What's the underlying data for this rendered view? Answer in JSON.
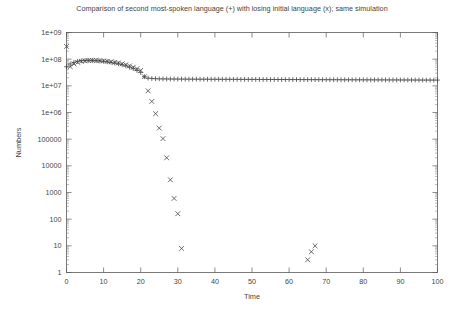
{
  "chart_data": {
    "type": "scatter",
    "title": "Comparison of second most-spoken language (+) with losing initial language (x); same simulation",
    "xlabel": "Time",
    "ylabel": "Numbers",
    "xlim": [
      0,
      100
    ],
    "ylim": [
      1,
      1000000000
    ],
    "yscale": "log",
    "xscale": "linear",
    "grid": false,
    "legend": "none",
    "xticks": [
      0,
      10,
      20,
      30,
      40,
      50,
      60,
      70,
      80,
      90,
      100
    ],
    "xtick_labels": [
      "0",
      "10",
      "20",
      "30",
      "40",
      "50",
      "60",
      "70",
      "80",
      "90",
      "100"
    ],
    "yticks": [
      1,
      10,
      100,
      1000,
      10000,
      100000,
      1000000,
      10000000,
      100000000,
      1000000000
    ],
    "ytick_labels": [
      "1",
      "10",
      "100",
      "1000",
      "10000",
      "100000",
      "1e+06",
      "1e+07",
      "1e+08",
      "1e+09"
    ],
    "series": [
      {
        "name": "second most-spoken language",
        "marker": "+",
        "color": "#3c3c3c",
        "x": [
          0,
          1,
          2,
          3,
          4,
          5,
          6,
          7,
          8,
          9,
          10,
          11,
          12,
          13,
          14,
          15,
          16,
          17,
          18,
          19,
          20,
          21,
          22,
          23,
          24,
          25,
          26,
          27,
          28,
          29,
          30,
          31,
          32,
          33,
          34,
          35,
          36,
          37,
          38,
          39,
          40,
          41,
          42,
          43,
          44,
          45,
          46,
          47,
          48,
          49,
          50,
          51,
          52,
          53,
          54,
          55,
          56,
          57,
          58,
          59,
          60,
          61,
          62,
          63,
          64,
          65,
          66,
          67,
          68,
          69,
          70,
          71,
          72,
          73,
          74,
          75,
          76,
          77,
          78,
          79,
          80,
          81,
          82,
          83,
          84,
          85,
          86,
          87,
          88,
          89,
          90,
          91,
          92,
          93,
          94,
          95,
          96,
          97,
          98,
          99,
          100
        ],
        "y": [
          52000000,
          66000000,
          76000000,
          83000000,
          87000000,
          89000000,
          90000000,
          89500000,
          88000000,
          86000000,
          83000000,
          80000000,
          76000000,
          72000000,
          67000000,
          62000000,
          56000000,
          50000000,
          44000000,
          38000000,
          32000000,
          22000000,
          19500000,
          18800000,
          18500000,
          18300000,
          18200000,
          18100000,
          18050000,
          18000000,
          17950000,
          17900000,
          17850000,
          17800000,
          17780000,
          17750000,
          17720000,
          17700000,
          17680000,
          17650000,
          17620000,
          17600000,
          17580000,
          17550000,
          17520000,
          17500000,
          17480000,
          17460000,
          17440000,
          17420000,
          17400000,
          17380000,
          17360000,
          17340000,
          17320000,
          17300000,
          17280000,
          17260000,
          17240000,
          17220000,
          17200000,
          17180000,
          17160000,
          17140000,
          17120000,
          17100000,
          17080000,
          17060000,
          17040000,
          17020000,
          17000000,
          16980000,
          16960000,
          16940000,
          16920000,
          16900000,
          16880000,
          16860000,
          16840000,
          16820000,
          16800000,
          16780000,
          16760000,
          16740000,
          16720000,
          16700000,
          16680000,
          16660000,
          16640000,
          16620000,
          16600000,
          16580000,
          16560000,
          16540000,
          16520000,
          16500000,
          16480000,
          16460000,
          16440000,
          16420000,
          16400000
        ]
      },
      {
        "name": "losing initial language",
        "marker": "x",
        "color": "#3c3c3c",
        "x": [
          0,
          1,
          2,
          3,
          4,
          5,
          6,
          7,
          8,
          9,
          10,
          11,
          12,
          13,
          14,
          15,
          16,
          17,
          18,
          19,
          20,
          21,
          22,
          23,
          24,
          25,
          26,
          27,
          28,
          29,
          30,
          31,
          65,
          66,
          67
        ],
        "y": [
          300000000,
          52000000,
          66000000,
          76000000,
          83000000,
          87000000,
          89000000,
          90000000,
          89500000,
          88000000,
          86000000,
          83000000,
          80000000,
          76000000,
          72000000,
          67000000,
          62000000,
          56000000,
          50000000,
          44000000,
          38000000,
          22000000,
          6500000,
          2600000,
          900000,
          260000,
          105000,
          20000,
          3000,
          600,
          160,
          8,
          3,
          6,
          10
        ]
      }
    ]
  }
}
